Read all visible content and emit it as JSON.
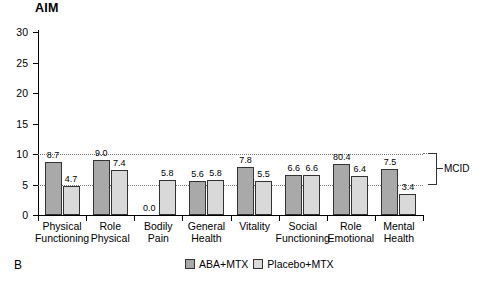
{
  "title": "AIM",
  "panel_letter": "B",
  "annotation": {
    "mcid_label": "MCID",
    "mcid_from": 5,
    "mcid_to": 10
  },
  "legend": [
    {
      "label": "ABA+MTX",
      "color": "#a9a9a9"
    },
    {
      "label": "Placebo+MTX",
      "color": "#d9d9d9"
    }
  ],
  "chart_data": {
    "type": "bar",
    "title": "AIM",
    "xlabel": "",
    "ylabel": "",
    "ylim": [
      0,
      30
    ],
    "yticks": [
      0,
      5,
      10,
      15,
      20,
      25,
      30
    ],
    "gridlines": [
      5,
      10
    ],
    "grid": true,
    "legend_position": "bottom",
    "categories": [
      "Physical Functioning",
      "Role Physical",
      "Bodily Pain",
      "General Health",
      "Vitality",
      "Social Functioning",
      "Role Emotional",
      "Mental Health"
    ],
    "category_lines": [
      [
        "Physical",
        "Functioning"
      ],
      [
        "Role",
        "Physical"
      ],
      [
        "Bodily",
        "Pain"
      ],
      [
        "General",
        "Health"
      ],
      [
        "Vitality",
        ""
      ],
      [
        "Social",
        "Functioning"
      ],
      [
        "Role",
        "Emotional"
      ],
      [
        "Mental",
        "Health"
      ]
    ],
    "series": [
      {
        "name": "ABA+MTX",
        "color": "#a9a9a9",
        "values": [
          8.7,
          9.0,
          0.0,
          5.6,
          7.8,
          6.6,
          8.4,
          7.5
        ],
        "labels": [
          "8.7",
          "9.0",
          "0.0",
          "5.6",
          "7.8",
          "6.6",
          "80.4",
          "7.5"
        ]
      },
      {
        "name": "Placebo+MTX",
        "color": "#d9d9d9",
        "values": [
          4.7,
          7.4,
          5.8,
          5.8,
          5.5,
          6.6,
          6.4,
          3.4
        ],
        "labels": [
          "4.7",
          "7.4",
          "5.8",
          "5.8",
          "5.5",
          "6.6",
          "6.4",
          "3.4"
        ]
      }
    ]
  }
}
